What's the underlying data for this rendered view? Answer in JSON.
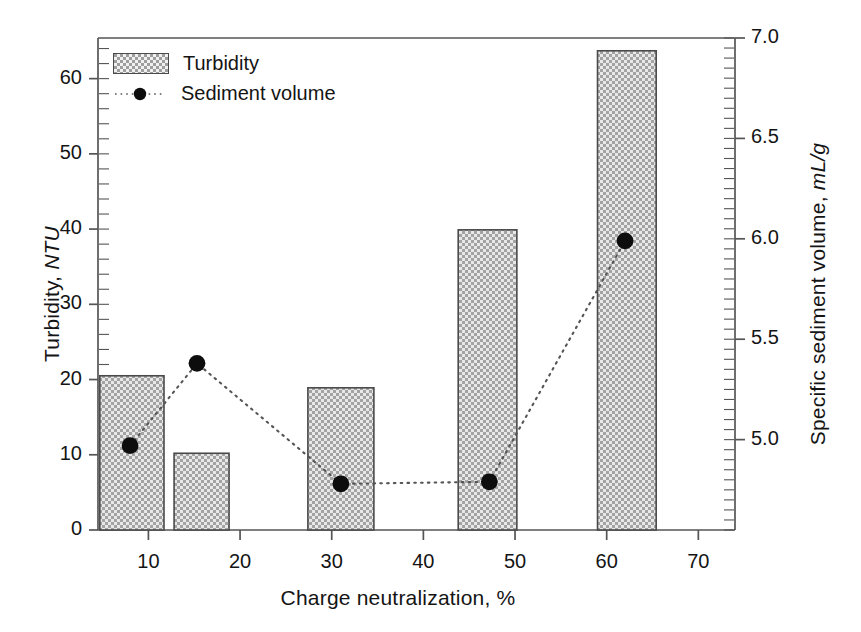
{
  "axes": {
    "y_left": {
      "title_main": "Turbidity, ",
      "title_unit": "NTU",
      "ticks": [
        "0",
        "10",
        "20",
        "30",
        "40",
        "50",
        "60"
      ],
      "range": [
        0,
        65.4
      ],
      "minor_tick_step": 2
    },
    "y_right": {
      "title_main": "Specific sediment volume, ",
      "title_unit": "mL/g",
      "ticks": [
        "5.0",
        "5.5",
        "6.0",
        "6.5",
        "7.0"
      ],
      "range": [
        4.55,
        7.0
      ],
      "minor_tick_step": 0.05
    },
    "x": {
      "title_main": "Charge neutralization, %",
      "ticks": [
        "10",
        "20",
        "30",
        "40",
        "50",
        "60",
        "70"
      ],
      "range": [
        4.5,
        74.0
      ]
    }
  },
  "legend": {
    "items": [
      {
        "label": "Turbidity",
        "key": "hatched-patch"
      },
      {
        "label": "Sediment volume",
        "key": "dotted-line-circle-marker"
      }
    ]
  },
  "style": {
    "bar_fill": "#9e9e9e",
    "bar_edge": "#4a4a4a",
    "marker_color": "#0d0d0d",
    "line_color": "#555555",
    "frame_color": "#555555"
  },
  "chart_data": {
    "type": "bar",
    "title": "",
    "xlabel": "Charge neutralization, %",
    "ylabel": "Turbidity, NTU",
    "ylabel_secondary": "Specific sediment volume, mL/g",
    "xlim": [
      4.5,
      74.0
    ],
    "ylim": [
      0,
      65.4
    ],
    "ylim_secondary": [
      4.55,
      7.0
    ],
    "grid": false,
    "legend_position": "top-left",
    "series": [
      {
        "name": "Turbidity",
        "type": "bar",
        "axis": "left",
        "unit": "NTU",
        "x_centers": [
          8.2,
          15.8,
          31.0,
          47.0,
          62.2
        ],
        "x_ranges": [
          [
            4.7,
            11.7
          ],
          [
            12.8,
            18.8
          ],
          [
            27.4,
            34.6
          ],
          [
            43.8,
            50.2
          ],
          [
            59.0,
            65.4
          ]
        ],
        "values": [
          20.5,
          10.2,
          18.9,
          39.9,
          63.7
        ]
      },
      {
        "name": "Sediment volume",
        "type": "line",
        "axis": "right",
        "unit": "mL/g",
        "x": [
          8.0,
          15.3,
          31.0,
          47.2,
          62.0
        ],
        "values": [
          4.97,
          5.38,
          4.78,
          4.79,
          5.99
        ]
      }
    ]
  }
}
